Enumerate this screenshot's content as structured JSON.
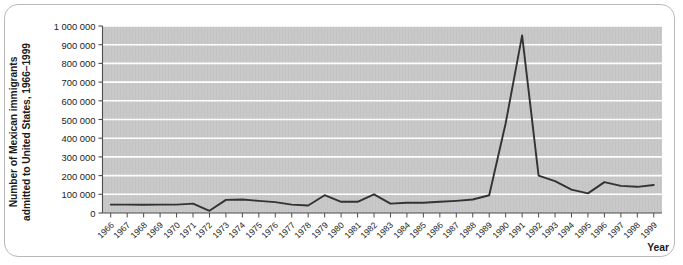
{
  "chart_data": {
    "type": "line",
    "title": "",
    "ylabel": "Number of Mexican immigrants admitted to United States, 1966–1999",
    "ylabel_line1": "Number of Mexican immigrants",
    "ylabel_line2": "admitted to United States, 1966–1999",
    "xlabel": "Year",
    "ylim": [
      0,
      1000000
    ],
    "xlim": [
      1966,
      1999
    ],
    "grid": true,
    "legend": false,
    "y_ticks": [
      0,
      100000,
      200000,
      300000,
      400000,
      500000,
      600000,
      700000,
      800000,
      900000,
      1000000
    ],
    "y_tick_labels": [
      "0",
      "100 000",
      "200 000",
      "300 000",
      "400 000",
      "500 000",
      "600 000",
      "700 000",
      "800 000",
      "900 000",
      "1 000 000"
    ],
    "categories": [
      "1966",
      "1967",
      "1968",
      "1969",
      "1970",
      "1971",
      "1972",
      "1973",
      "1974",
      "1975",
      "1976",
      "1977",
      "1978",
      "1979",
      "1980",
      "1981",
      "1982",
      "1983",
      "1984",
      "1985",
      "1986",
      "1987",
      "1988",
      "1989",
      "1990",
      "1991",
      "1992",
      "1993",
      "1994",
      "1995",
      "1996",
      "1997",
      "1998",
      "1999"
    ],
    "values": [
      45000,
      45000,
      44000,
      45000,
      45000,
      50000,
      12000,
      70000,
      72000,
      65000,
      58000,
      45000,
      40000,
      95000,
      60000,
      60000,
      100000,
      50000,
      55000,
      55000,
      60000,
      65000,
      72000,
      95000,
      480000,
      950000,
      200000,
      170000,
      125000,
      105000,
      165000,
      145000,
      140000,
      150000
    ],
    "series_name": "Mexican immigrants admitted",
    "line_color": "#333333",
    "plot_bg_color": "#c8c8c8",
    "gridline_color": "#ffffff",
    "axis_color": "#4d4d4d"
  }
}
